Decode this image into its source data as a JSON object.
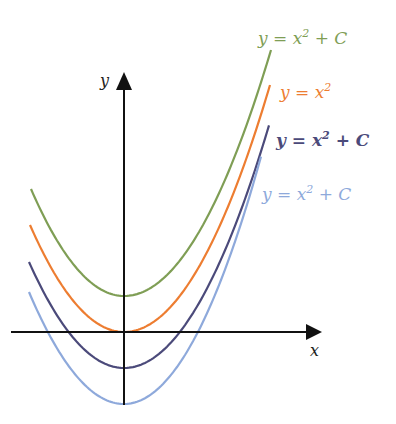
{
  "diagram": {
    "axes": {
      "x_label": "x",
      "y_label": "y"
    },
    "curves": [
      {
        "name": "green",
        "label_base": "y = x",
        "label_sup": "2",
        "label_tail": " + C",
        "color": "#7f9e55",
        "C": 1,
        "bold": false
      },
      {
        "name": "orange",
        "label_base": "y = x",
        "label_sup": "2",
        "label_tail": "",
        "color": "#ed7d31",
        "C": 0,
        "bold": false
      },
      {
        "name": "purple",
        "label_base": "y = x",
        "label_sup": "2",
        "label_tail": " + C",
        "color": "#4b4a7a",
        "C": -1,
        "bold": true
      },
      {
        "name": "blue",
        "label_base": "y = x",
        "label_sup": "2",
        "label_tail": " + C",
        "color": "#8ea9db",
        "C": -2,
        "bold": false
      }
    ]
  }
}
